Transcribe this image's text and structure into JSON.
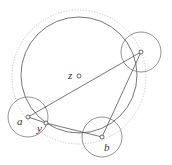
{
  "diagram": {
    "colors": {
      "stroke": "#555555",
      "dotted": "#bbbbbb",
      "point_fill": "#ffffff"
    },
    "center": {
      "label": "z",
      "x": 79,
      "y": 76
    },
    "outer_dotted_circle": {
      "cx": 79,
      "cy": 77,
      "r": 67
    },
    "main_circle": {
      "cx": 79,
      "cy": 75,
      "r": 58
    },
    "points": [
      {
        "id": "a",
        "label": "a",
        "x": 28,
        "y": 117,
        "label_x": 17,
        "label_y": 125
      },
      {
        "id": "y",
        "label": "y",
        "x": 46,
        "y": 123,
        "label_x": 37,
        "label_y": 132
      },
      {
        "id": "b",
        "label": "b",
        "x": 102,
        "y": 137,
        "label_x": 104,
        "label_y": 151
      },
      {
        "id": "c",
        "label": "",
        "x": 141,
        "y": 52
      }
    ],
    "small_circles": [
      {
        "around": "a",
        "cx": 28,
        "cy": 117,
        "r": 20
      },
      {
        "around": "b",
        "cx": 102,
        "cy": 137,
        "r": 20
      },
      {
        "around": "c",
        "cx": 141,
        "cy": 52,
        "r": 20
      }
    ],
    "segments": [
      {
        "from": "a",
        "to": "c"
      },
      {
        "from": "a",
        "to": "y"
      },
      {
        "from": "y",
        "to": "b"
      },
      {
        "from": "c",
        "to": "b"
      }
    ]
  }
}
